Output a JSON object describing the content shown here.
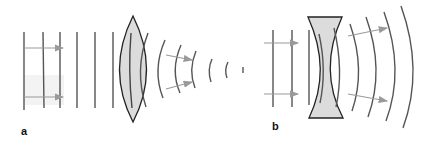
{
  "figure": {
    "panels": [
      {
        "id": "a",
        "label": "a",
        "lens_type": "converging (biconvex)",
        "description": "Plane wavefronts enter a convex lens and emerge as converging spherical wavefronts"
      },
      {
        "id": "b",
        "label": "b",
        "lens_type": "diverging (biconcave)",
        "description": "Plane wavefronts enter a concave lens and emerge as diverging spherical wavefronts"
      }
    ],
    "colors": {
      "wavefront": "#555555",
      "arrow": "#9a9a9a",
      "lens_fill": "#dcdcdc",
      "lens_stroke": "#222222",
      "label": "#111111"
    }
  }
}
